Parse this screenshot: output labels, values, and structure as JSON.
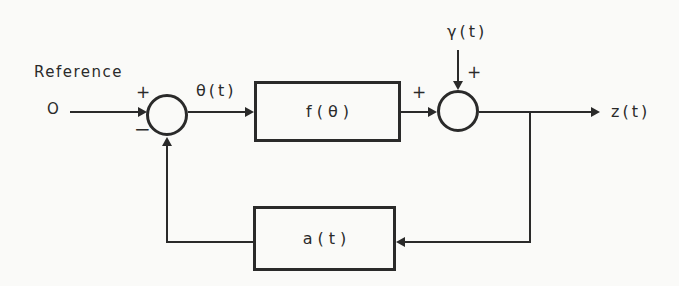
{
  "diagram": {
    "type": "feedback-control-block-diagram",
    "colors": {
      "line": "#2a2a2a",
      "background": "#fafaf8"
    },
    "reference_label": "Reference",
    "input_value": "O",
    "error_signal_label": "θ(t)",
    "disturbance_label": "γ(t)",
    "output_label": "z(t)",
    "forward_block_label": "f(θ)",
    "feedback_block_label": "a(t)",
    "sum1": {
      "plus": "+",
      "minus": "−"
    },
    "sum2": {
      "left_plus": "+",
      "top_plus": "+"
    }
  }
}
